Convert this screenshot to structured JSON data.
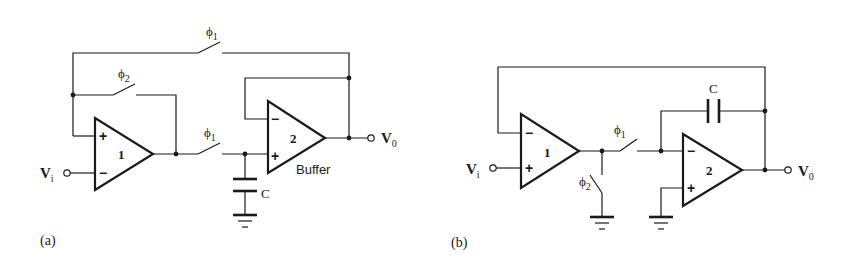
{
  "figure": {
    "panels": [
      {
        "id": "a",
        "caption": "(a)",
        "input_label": "V",
        "input_sub": "i",
        "output_label": "V",
        "output_sub": "0",
        "opamp1": {
          "number": "1",
          "plus": "+",
          "minus": "−"
        },
        "opamp2": {
          "number": "2",
          "plus": "+",
          "minus": "−",
          "label": "Buffer"
        },
        "switch_top": {
          "phase": "ϕ",
          "phase_sub": "1"
        },
        "switch_feedback": {
          "phase": "ϕ",
          "phase_sub": "2"
        },
        "switch_series": {
          "phase": "ϕ",
          "phase_sub": "1"
        },
        "capacitor": {
          "label": "C"
        }
      },
      {
        "id": "b",
        "caption": "(b)",
        "input_label": "V",
        "input_sub": "i",
        "output_label": "V",
        "output_sub": "0",
        "opamp1": {
          "number": "1",
          "plus": "+",
          "minus": "−"
        },
        "opamp2": {
          "number": "2",
          "plus": "+",
          "minus": "−"
        },
        "switch_series": {
          "phase": "ϕ",
          "phase_sub": "1"
        },
        "switch_shunt": {
          "phase": "ϕ",
          "phase_sub": "2"
        },
        "capacitor": {
          "label": "C"
        }
      }
    ]
  }
}
